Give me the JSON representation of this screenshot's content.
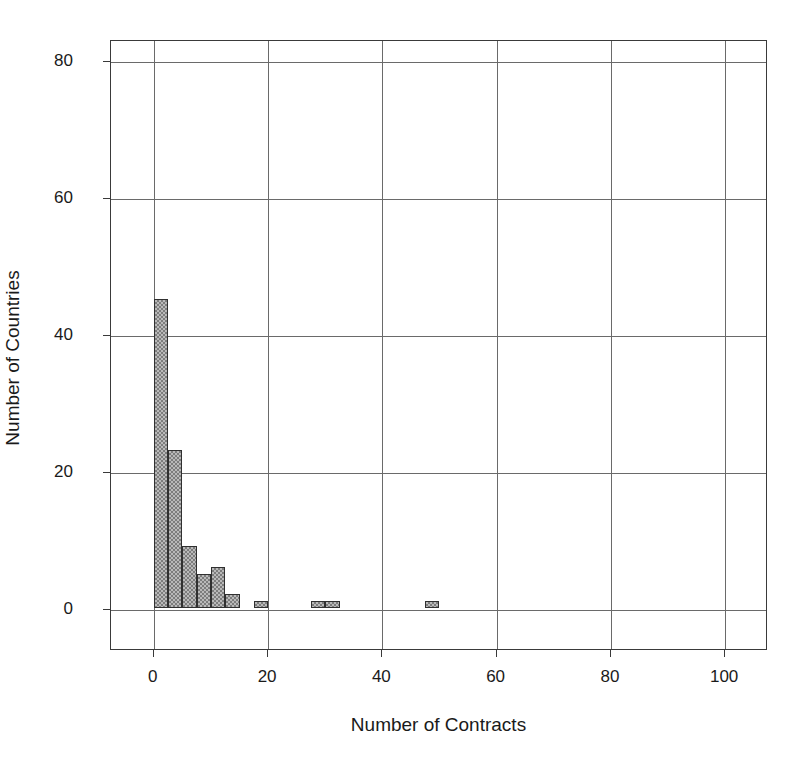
{
  "chart_data": {
    "type": "bar",
    "subtype": "histogram",
    "title": "",
    "xlabel": "Number of Contracts",
    "ylabel": "Number of Countries",
    "xlim": [
      -7.5,
      107.5
    ],
    "ylim": [
      -6,
      83
    ],
    "grid": true,
    "legend": null,
    "bin_width": 2.5,
    "x_ticks": [
      0,
      20,
      40,
      60,
      80,
      100
    ],
    "x_tick_labels": [
      "0",
      "20",
      "40",
      "60",
      "80",
      "100"
    ],
    "y_ticks": [
      0,
      20,
      40,
      60,
      80
    ],
    "y_tick_labels": [
      "0",
      "20",
      "40",
      "60",
      "80"
    ],
    "bins": [
      {
        "x_start": 0.0,
        "x_end": 2.5,
        "count": 45
      },
      {
        "x_start": 2.5,
        "x_end": 5.0,
        "count": 23
      },
      {
        "x_start": 5.0,
        "x_end": 7.5,
        "count": 9
      },
      {
        "x_start": 7.5,
        "x_end": 10.0,
        "count": 5
      },
      {
        "x_start": 10.0,
        "x_end": 12.5,
        "count": 6
      },
      {
        "x_start": 12.5,
        "x_end": 15.0,
        "count": 2
      },
      {
        "x_start": 17.5,
        "x_end": 20.0,
        "count": 1
      },
      {
        "x_start": 27.5,
        "x_end": 30.0,
        "count": 1
      },
      {
        "x_start": 30.0,
        "x_end": 32.5,
        "count": 1
      },
      {
        "x_start": 47.5,
        "x_end": 50.0,
        "count": 1
      }
    ],
    "colors": {
      "bar_fill": "#b9b9b9",
      "bar_pattern": "#7d7d7d",
      "bar_edge": "#303030",
      "grid": "#6a6a6a",
      "frame": "#3a3a3a",
      "text": "#1a1a1a",
      "background": "#ffffff"
    }
  }
}
